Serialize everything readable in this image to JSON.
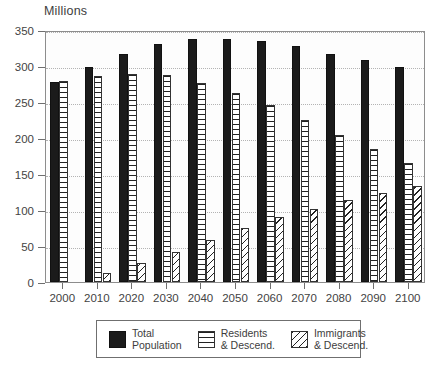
{
  "chart_data": {
    "type": "bar",
    "title": "",
    "subtitle": "",
    "xlabel": "",
    "ylabel": "Millions",
    "axis_title": "Millions",
    "categories": [
      "2000",
      "2010",
      "2020",
      "2030",
      "2040",
      "2050",
      "2060",
      "2070",
      "2080",
      "2090",
      "2100"
    ],
    "ylim": [
      0,
      350
    ],
    "yticks": [
      0,
      50,
      100,
      150,
      200,
      250,
      300,
      350
    ],
    "ytick_labels": [
      "0",
      "50",
      "100",
      "150",
      "200",
      "250",
      "300",
      "350"
    ],
    "grid": true,
    "grid_axis": "y",
    "legend_position": "bottom",
    "series": [
      {
        "name": "Total Population",
        "legend_line1": "Total",
        "legend_line2": "Population",
        "pattern": "solid",
        "color": "#1b1b1b",
        "values": [
          278,
          298,
          316,
          330,
          337,
          337,
          335,
          328,
          317,
          309,
          298
        ]
      },
      {
        "name": "Residents & Descend.",
        "legend_line1": "Residents",
        "legend_line2": "& Descend.",
        "pattern": "horizontal-stripes",
        "color": "#222222",
        "values": [
          279,
          286,
          289,
          288,
          277,
          262,
          246,
          225,
          204,
          185,
          165
        ]
      },
      {
        "name": "Immigrants & Descend.",
        "legend_line1": "Immigrants",
        "legend_line2": "& Descend.",
        "pattern": "diagonal-stripes",
        "color": "#222222",
        "values": [
          0,
          13,
          27,
          42,
          59,
          75,
          90,
          102,
          114,
          124,
          134
        ]
      }
    ]
  }
}
